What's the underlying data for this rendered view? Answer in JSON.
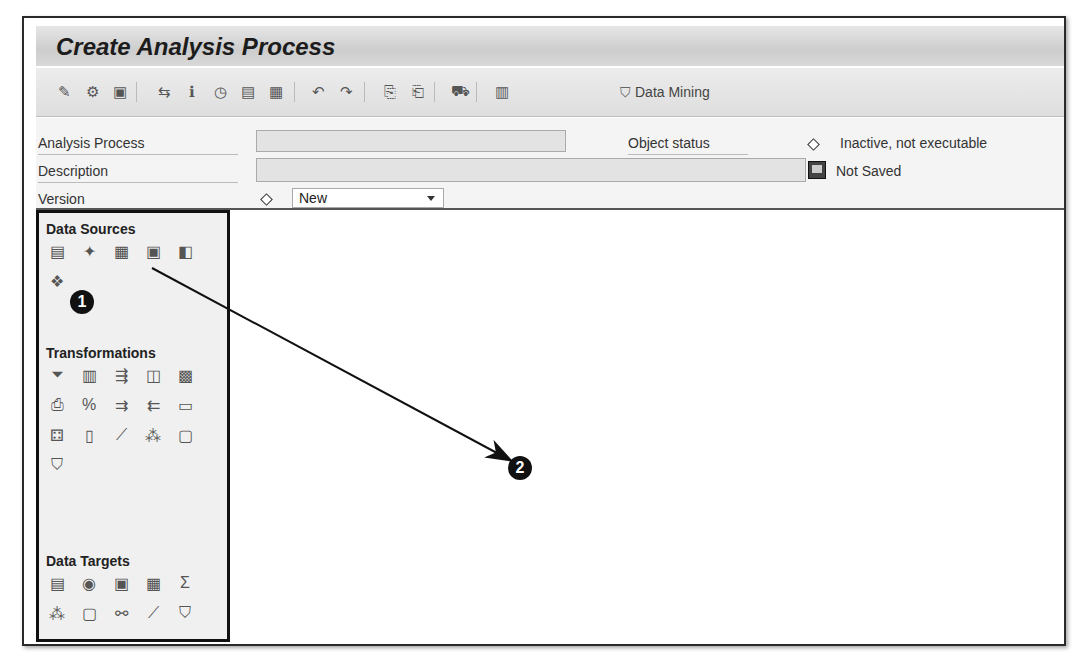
{
  "window": {
    "title": "Create Analysis Process"
  },
  "toolbar": {
    "icons": [
      {
        "name": "display-change-icon",
        "glyph": "✎",
        "x": 18
      },
      {
        "name": "check-icon",
        "glyph": "⚙",
        "x": 46
      },
      {
        "name": "layout-icon",
        "glyph": "▣",
        "x": 74
      },
      {
        "name": "hierarchy-icon",
        "glyph": "⇆",
        "x": 118
      },
      {
        "name": "info-icon",
        "glyph": "ℹ",
        "x": 146
      },
      {
        "name": "schedule-icon",
        "glyph": "◷",
        "x": 174
      },
      {
        "name": "document-icon",
        "glyph": "▤",
        "x": 202
      },
      {
        "name": "monitor-icon",
        "glyph": "▦",
        "x": 230
      },
      {
        "name": "undo-icon",
        "glyph": "↶",
        "x": 272
      },
      {
        "name": "redo-icon",
        "glyph": "↷",
        "x": 300
      },
      {
        "name": "copy-icon",
        "glyph": "⎘",
        "x": 344
      },
      {
        "name": "paste-icon",
        "glyph": "⎗",
        "x": 372
      },
      {
        "name": "transport-icon",
        "glyph": "⛟",
        "x": 414
      },
      {
        "name": "table-icon",
        "glyph": "▥",
        "x": 456
      }
    ],
    "separators": [
      100,
      258,
      328,
      398,
      440
    ],
    "data_mining_label": "Data Mining"
  },
  "header": {
    "analysis_process_label": "Analysis Process",
    "analysis_process_value": "",
    "description_label": "Description",
    "description_value": "",
    "version_label": "Version",
    "version_value": "New",
    "object_status_label": "Object status",
    "object_status_value": "Inactive, not executable",
    "save_status_value": "Not Saved"
  },
  "palette": {
    "data_sources": {
      "title": "Data Sources",
      "items": [
        "infocube-icon",
        "multiprovider-icon",
        "database-table-icon",
        "psa-icon",
        "dso-icon",
        "query-icon"
      ]
    },
    "transformations": {
      "title": "Transformations",
      "items": [
        "filter-icon",
        "join-icon",
        "projection-icon",
        "union-icon",
        "sort-icon",
        "aggregation-icon",
        "percent-icon",
        "list-to-table-icon",
        "table-to-list-icon",
        "abap-routine-icon",
        "restrict-icon",
        "transform-table-icon",
        "regression-icon",
        "decision-tree-icon",
        "prediction-icon",
        "association-icon"
      ]
    },
    "data_targets": {
      "title": "Data Targets",
      "items": [
        "infocube-target-icon",
        "dso-target-icon",
        "psa-target-icon",
        "crm-target-icon",
        "sum-target-icon",
        "decision-tree-target-icon",
        "prediction-target-icon",
        "clustering-target-icon",
        "regression-target-icon",
        "association-target-icon"
      ]
    }
  },
  "callouts": [
    {
      "label": "1",
      "x": 82,
      "y": 302
    },
    {
      "label": "2",
      "x": 520,
      "y": 468
    }
  ]
}
